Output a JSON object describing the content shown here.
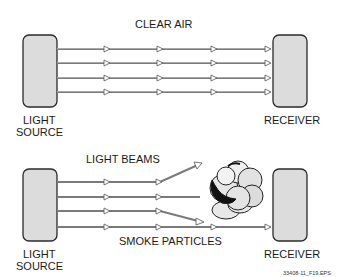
{
  "panels": [
    {
      "title": "CLEAR AIR",
      "source_label": [
        "LIGHT",
        "SOURCE"
      ],
      "receiver_label": "RECEIVER",
      "beam_count": 4
    },
    {
      "title": "LIGHT BEAMS",
      "source_label": [
        "LIGHT",
        "SOURCE"
      ],
      "receiver_label": "RECEIVER",
      "particles_label": "SMOKE PARTICLES",
      "beam_count": 4
    }
  ],
  "figure_id": "33408-11_F19.EPS"
}
